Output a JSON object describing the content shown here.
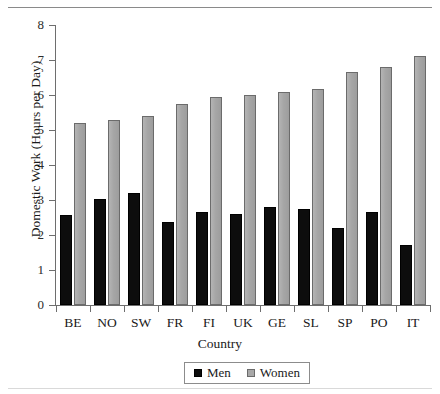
{
  "figure": {
    "background": "#ffffff",
    "rules": {
      "top": true,
      "bottom": true
    }
  },
  "chart_data": {
    "type": "bar",
    "title": "",
    "xlabel": "Country",
    "ylabel": "Domestic Work (Hours per Day)",
    "categories": [
      "BE",
      "NO",
      "SW",
      "FR",
      "FI",
      "UK",
      "GE",
      "SL",
      "SP",
      "PO",
      "IT"
    ],
    "series": [
      {
        "name": "Men",
        "color": "#0d0d0d",
        "values": [
          2.57,
          3.02,
          3.19,
          2.38,
          2.67,
          2.59,
          2.79,
          2.75,
          2.2,
          2.65,
          1.72
        ]
      },
      {
        "name": "Women",
        "color": "#a8a8a8",
        "values": [
          5.19,
          5.28,
          5.41,
          5.73,
          5.95,
          5.99,
          6.08,
          6.16,
          6.66,
          6.81,
          7.12
        ]
      }
    ],
    "ylim": [
      0,
      8
    ],
    "yticks": [
      0,
      1,
      2,
      3,
      4,
      5,
      6,
      7,
      8
    ],
    "ytick_labels": [
      "0",
      "1",
      "2",
      "3",
      "4",
      "5",
      "6",
      "7",
      "8"
    ],
    "grid": false,
    "legend_position": "bottom-center",
    "legend_entries": [
      "Men",
      "Women"
    ]
  }
}
